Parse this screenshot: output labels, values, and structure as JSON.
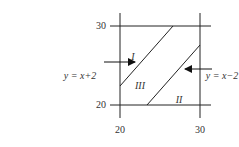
{
  "diagram": {
    "axis": {
      "x_ticks": [
        {
          "value": "20",
          "label": "20"
        },
        {
          "value": "30",
          "label": "30"
        }
      ],
      "y_ticks": [
        {
          "value": "30",
          "label": "30"
        },
        {
          "value": "20",
          "label": "20"
        }
      ]
    },
    "lines": [
      {
        "label": "y = x+2",
        "equation": "y = x + 2"
      },
      {
        "label": "y = x−2",
        "equation": "y = x - 2"
      }
    ],
    "regions": [
      {
        "label": "I"
      },
      {
        "label": "II"
      },
      {
        "label": "III"
      }
    ],
    "colors": {
      "stroke": "#222222",
      "text": "#333333"
    }
  }
}
